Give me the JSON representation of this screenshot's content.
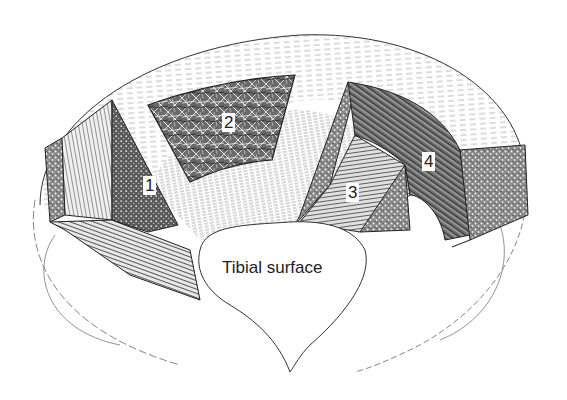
{
  "figure": {
    "labels": [
      {
        "id": "1",
        "text": "1",
        "x": 143,
        "y": 176
      },
      {
        "id": "2",
        "text": "2",
        "x": 222,
        "y": 113
      },
      {
        "id": "3",
        "text": "3",
        "x": 346,
        "y": 183
      },
      {
        "id": "4",
        "text": "4",
        "x": 422,
        "y": 152
      }
    ],
    "surface_label": {
      "text": "Tibial surface",
      "x": 222,
      "y": 258
    }
  },
  "colors": {
    "ink": "#222222",
    "hatch_dark": "#3a3a3a",
    "hatch_mid": "#7a7a7a",
    "hatch_light": "#bdbdbd",
    "background": "#ffffff"
  }
}
